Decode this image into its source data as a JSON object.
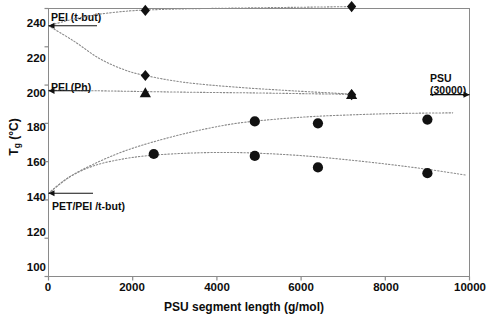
{
  "chart_data": {
    "type": "scatter",
    "title": "",
    "xlabel": "PSU segment length (g/mol)",
    "ylabel": "Tg (°C)",
    "ylabel_main": "T",
    "ylabel_sub": "g",
    "ylabel_unit": " (°C)",
    "xlim": [
      0,
      10000
    ],
    "ylim": [
      100,
      240
    ],
    "xticks": [
      "0",
      "2000",
      "4000",
      "6000",
      "8000",
      "10000"
    ],
    "xtick_values": [
      0,
      2000,
      4000,
      6000,
      8000,
      10000
    ],
    "yticks": [
      "100",
      "120",
      "140",
      "160",
      "180",
      "200",
      "220",
      "240"
    ],
    "ytick_values": [
      100,
      120,
      140,
      160,
      180,
      200,
      220,
      240
    ],
    "grid": false,
    "legend_position": "none",
    "marker_color": "#111111",
    "curve_color": "#8a8a8a",
    "axis_color": "#8a8a8a",
    "series": [
      {
        "name": "PEI (t-but) blend Tg",
        "marker": "diamond",
        "x": [
          2300,
          7200
        ],
        "y": [
          239,
          241
        ],
        "curve": [
          [
            0,
            231
          ],
          [
            600,
            234.5
          ],
          [
            1200,
            237
          ],
          [
            1800,
            238.5
          ],
          [
            2300,
            239.2
          ],
          [
            3200,
            239.8
          ],
          [
            4400,
            240.2
          ],
          [
            5800,
            240.6
          ],
          [
            7200,
            241
          ]
        ]
      },
      {
        "name": "PEI (Ph) blend Tg descending",
        "marker": "diamond",
        "x": [
          2300,
          7200
        ],
        "y": [
          205,
          195
        ],
        "curve": [
          [
            0,
            231
          ],
          [
            600,
            223
          ],
          [
            1200,
            214
          ],
          [
            1800,
            208
          ],
          [
            2300,
            205
          ],
          [
            3200,
            201.5
          ],
          [
            4400,
            199
          ],
          [
            5800,
            197
          ],
          [
            7200,
            195.3
          ]
        ]
      },
      {
        "name": "PEI (Ph) flat Tg",
        "marker": "triangle",
        "x": [
          2300,
          7200
        ],
        "y": [
          196,
          195
        ],
        "curve": [
          [
            0,
            197.3
          ],
          [
            1200,
            197
          ],
          [
            2300,
            196.6
          ],
          [
            3600,
            196.2
          ],
          [
            4900,
            195.9
          ],
          [
            6100,
            195.5
          ],
          [
            7200,
            195.2
          ]
        ]
      },
      {
        "name": "PET/PEI (t-but) upper Tg",
        "marker": "circle",
        "x": [
          4900,
          6400,
          9000
        ],
        "y": [
          181,
          180,
          182
        ],
        "curve": [
          [
            0,
            143.5
          ],
          [
            500,
            152
          ],
          [
            1100,
            159
          ],
          [
            1800,
            165.5
          ],
          [
            2600,
            171
          ],
          [
            3500,
            176
          ],
          [
            4400,
            179.8
          ],
          [
            5300,
            182
          ],
          [
            6300,
            183.6
          ],
          [
            7400,
            184.6
          ],
          [
            8400,
            185.2
          ],
          [
            9600,
            185.5
          ]
        ]
      },
      {
        "name": "PET/PEI (t-but) lower Tg",
        "marker": "circle",
        "x": [
          2500,
          4900,
          6400,
          9000
        ],
        "y": [
          164,
          163,
          157,
          154
        ],
        "curve": [
          [
            0,
            143.5
          ],
          [
            500,
            152
          ],
          [
            1100,
            158
          ],
          [
            1800,
            161.5
          ],
          [
            2500,
            163.4
          ],
          [
            3400,
            164.5
          ],
          [
            4300,
            164.8
          ],
          [
            5200,
            164.2
          ],
          [
            6100,
            163
          ],
          [
            7000,
            161.2
          ],
          [
            8000,
            158.8
          ],
          [
            9000,
            156
          ],
          [
            9900,
            153
          ]
        ]
      }
    ],
    "annotations": [
      {
        "id": "pei-tbut",
        "text": "PEI (t-but)",
        "arrow_to_y": 231,
        "arrow": true
      },
      {
        "id": "pei-ph",
        "text": "PEI (Ph)",
        "arrow_to_y": 197,
        "arrow": true
      },
      {
        "id": "pet-pei",
        "text": "PET/PEI /t-but)",
        "arrow_to_y": 143.5,
        "arrow": true
      },
      {
        "id": "psu",
        "line1": "PSU",
        "line2": "(30000)",
        "arrow_to_y": 195,
        "arrow": true
      }
    ]
  }
}
